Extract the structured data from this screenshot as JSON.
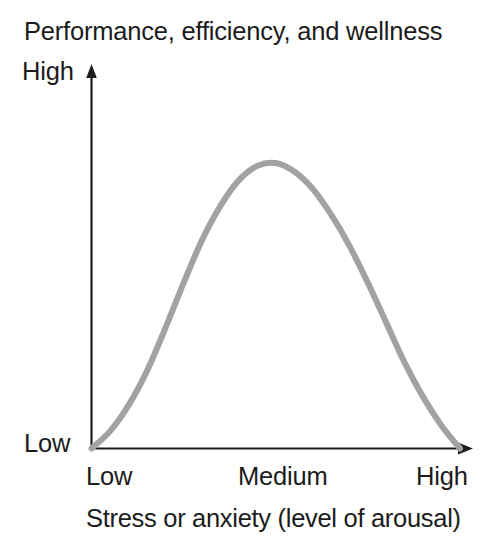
{
  "chart_data": {
    "type": "line",
    "title": "Performance, efficiency, and wellness",
    "xlabel": "Stress or anxiety (level of arousal)",
    "ylabel": "Performance, efficiency, and wellness",
    "x_tick_labels": [
      "Low",
      "Medium",
      "High"
    ],
    "y_tick_labels": [
      "Low",
      "High"
    ],
    "y_axis_low_label": "Low",
    "y_axis_high_label": "High",
    "grid": false,
    "legend": "none",
    "xlim": [
      "Low",
      "High"
    ],
    "ylim": [
      "Low",
      "High"
    ],
    "series": [
      {
        "name": "Inverted-U (Yerkes-Dodson) curve",
        "color": "#a2a2a2",
        "line_width_px": 6,
        "x": [
          0,
          5,
          10,
          15,
          20,
          25,
          30,
          35,
          40,
          45,
          50,
          55,
          60,
          65,
          70,
          75,
          80,
          85,
          90,
          95,
          100
        ],
        "values": [
          0,
          6,
          15,
          27,
          42,
          58,
          73,
          85,
          94,
          99,
          100,
          97,
          91,
          82,
          71,
          58,
          44,
          30,
          18,
          8,
          0
        ]
      }
    ],
    "annotations": [
      {
        "name": "y-axis-arrow",
        "direction": "up"
      },
      {
        "name": "x-axis-arrow",
        "direction": "right"
      }
    ]
  },
  "colors": {
    "background": "#ffffff",
    "axis": "#1c1c1c",
    "text": "#1c1c1c",
    "curve": "#a2a2a2"
  }
}
